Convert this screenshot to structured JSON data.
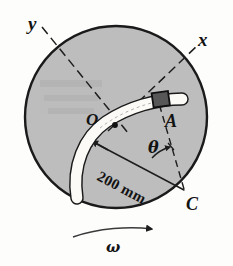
{
  "figure": {
    "axes": {
      "x_label": "x",
      "y_label": "y"
    },
    "points": {
      "center_label": "O",
      "block_label": "A",
      "pivot_label": "C"
    },
    "angle_label": "θ",
    "angular_velocity_label": "ω",
    "dimension_label": "200 mm",
    "colors": {
      "disk_fill": "#bdbdbd",
      "disk_edge": "#1a1a1a",
      "slot_fill": "#fbfaf6",
      "slot_edge": "#1a1a1a",
      "block_fill": "#575757",
      "block_edge": "#101010",
      "line": "#1d1d1d",
      "background": "#fdfdfc"
    },
    "icons": {
      "rotation_arrow": "curved-arrow-icon",
      "dimension_arrow": "dimension-arrow-icon",
      "angle_arc_arrow": "angle-arc-arrow-icon"
    }
  }
}
